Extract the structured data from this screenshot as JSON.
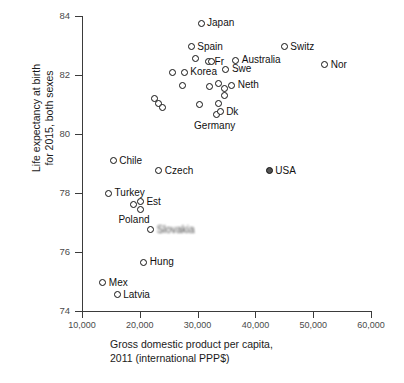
{
  "chart_data": {
    "type": "scatter",
    "title": "",
    "xlabel": "Gross domestic product per capita, 2011 (international PPP$)",
    "xlabel_line1": "Gross domestic product per capita,",
    "xlabel_line2": "2011 (international PPP$)",
    "ylabel": "Life expectancy at birth for 2015, both sexes",
    "ylabel_line1": "Life expectancy at birth",
    "ylabel_line2": "for 2015, both sexes",
    "xlim": [
      10000,
      60000
    ],
    "ylim": [
      74,
      84
    ],
    "xticks": [
      "10,000",
      "20,000",
      "30,000",
      "40,000",
      "50,000",
      "60,000"
    ],
    "xtick_values": [
      10000,
      20000,
      30000,
      40000,
      50000,
      60000
    ],
    "yticks": [
      "84",
      "82",
      "80",
      "78",
      "76",
      "74"
    ],
    "ytick_values": [
      84,
      82,
      80,
      78,
      76,
      74
    ],
    "grid": false,
    "legend": "none",
    "marker_styles": {
      "default": "open-circle",
      "highlight": "filled-circle"
    },
    "points": [
      {
        "label": "Japan",
        "x": 30600,
        "y": 83.75,
        "filled": false,
        "label_pos": "right"
      },
      {
        "label": "Spain",
        "x": 28900,
        "y": 82.95,
        "filled": false,
        "label_pos": "right"
      },
      {
        "label": "Switz",
        "x": 45000,
        "y": 82.95,
        "filled": false,
        "label_pos": "right"
      },
      {
        "label": "",
        "x": 29700,
        "y": 82.55,
        "filled": false,
        "label_pos": "right"
      },
      {
        "label": "Fr",
        "x": 31900,
        "y": 82.45,
        "filled": false,
        "label_pos": "right"
      },
      {
        "label": "",
        "x": 32400,
        "y": 82.45,
        "filled": false,
        "label_pos": "right"
      },
      {
        "label": "Australia",
        "x": 36600,
        "y": 82.5,
        "filled": false,
        "label_pos": "right"
      },
      {
        "label": "Nor",
        "x": 52000,
        "y": 82.35,
        "filled": false,
        "label_pos": "right"
      },
      {
        "label": "Swe",
        "x": 34900,
        "y": 82.2,
        "filled": false,
        "label_pos": "right"
      },
      {
        "label": "",
        "x": 25600,
        "y": 82.1,
        "filled": false,
        "label_pos": "right"
      },
      {
        "label": "Korea",
        "x": 27700,
        "y": 82.1,
        "filled": false,
        "label_pos": "right"
      },
      {
        "label": "",
        "x": 27400,
        "y": 81.65,
        "filled": false,
        "label_pos": "right"
      },
      {
        "label": "",
        "x": 32100,
        "y": 81.6,
        "filled": false,
        "label_pos": "right"
      },
      {
        "label": "",
        "x": 33700,
        "y": 81.72,
        "filled": false,
        "label_pos": "right"
      },
      {
        "label": "",
        "x": 34600,
        "y": 81.55,
        "filled": false,
        "label_pos": "right"
      },
      {
        "label": "Neth",
        "x": 35900,
        "y": 81.65,
        "filled": false,
        "label_pos": "right"
      },
      {
        "label": "",
        "x": 34600,
        "y": 81.3,
        "filled": false,
        "label_pos": "right"
      },
      {
        "label": "",
        "x": 22600,
        "y": 81.2,
        "filled": false,
        "label_pos": "right"
      },
      {
        "label": "",
        "x": 23300,
        "y": 81.05,
        "filled": false,
        "label_pos": "right"
      },
      {
        "label": "",
        "x": 23900,
        "y": 80.9,
        "filled": false,
        "label_pos": "right"
      },
      {
        "label": "",
        "x": 30400,
        "y": 81.0,
        "filled": false,
        "label_pos": "right"
      },
      {
        "label": "",
        "x": 33600,
        "y": 81.05,
        "filled": false,
        "label_pos": "right"
      },
      {
        "label": "Germany",
        "x": 33200,
        "y": 80.65,
        "filled": false,
        "label_pos": "below"
      },
      {
        "label": "Dk",
        "x": 33900,
        "y": 80.75,
        "filled": false,
        "label_pos": "right"
      },
      {
        "label": "Chile",
        "x": 15400,
        "y": 79.1,
        "filled": false,
        "label_pos": "right"
      },
      {
        "label": "Czech",
        "x": 23300,
        "y": 78.75,
        "filled": false,
        "label_pos": "right"
      },
      {
        "label": "USA",
        "x": 42400,
        "y": 78.75,
        "filled": true,
        "label_pos": "right"
      },
      {
        "label": "Turkey",
        "x": 14600,
        "y": 78.0,
        "filled": false,
        "label_pos": "right"
      },
      {
        "label": "",
        "x": 18900,
        "y": 77.6,
        "filled": false,
        "label_pos": "right"
      },
      {
        "label": "Est",
        "x": 20100,
        "y": 77.7,
        "filled": false,
        "label_pos": "right"
      },
      {
        "label": "Poland",
        "x": 20100,
        "y": 77.45,
        "filled": false,
        "label_pos": "below"
      },
      {
        "label": "Slovakia",
        "x": 21900,
        "y": 76.75,
        "filled": false,
        "label_pos": "right-blur"
      },
      {
        "label": "Hung",
        "x": 20700,
        "y": 75.65,
        "filled": false,
        "label_pos": "right"
      },
      {
        "label": "Mex",
        "x": 13600,
        "y": 74.95,
        "filled": false,
        "label_pos": "right"
      },
      {
        "label": "Latvia",
        "x": 16100,
        "y": 74.55,
        "filled": false,
        "label_pos": "right"
      }
    ]
  }
}
